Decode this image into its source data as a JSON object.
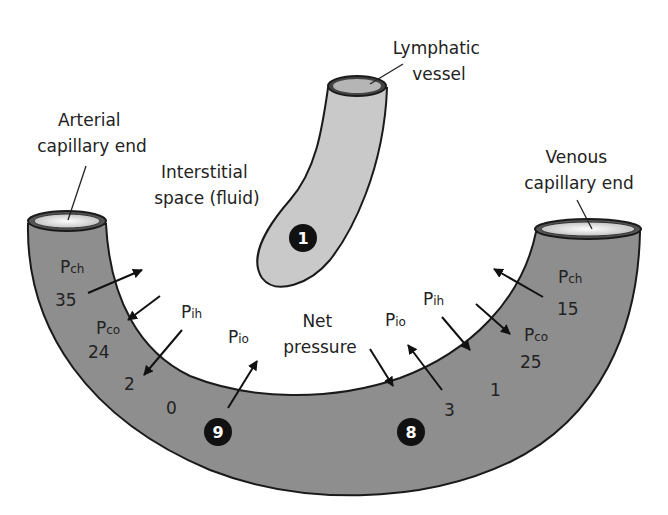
{
  "labels": {
    "arterial": [
      "Arterial",
      "capillary end"
    ],
    "venous": [
      "Venous",
      "capillary end"
    ],
    "lymphatic": [
      "Lymphatic",
      "vessel"
    ],
    "interstitial": [
      "Interstitial",
      "space (fluid)"
    ],
    "net_pressure": [
      "Net",
      "pressure"
    ]
  },
  "arterial_pressures": {
    "pch": {
      "symbol": "P",
      "sub": "ch",
      "value": "35"
    },
    "pco": {
      "symbol": "P",
      "sub": "co",
      "value": "24"
    },
    "pih": {
      "symbol": "P",
      "sub": "ih",
      "value": "2"
    },
    "pio": {
      "symbol": "P",
      "sub": "io",
      "value": "0"
    }
  },
  "venous_pressures": {
    "pch": {
      "symbol": "P",
      "sub": "ch",
      "value": "15"
    },
    "pco": {
      "symbol": "P",
      "sub": "co",
      "value": "25"
    },
    "pih": {
      "symbol": "P",
      "sub": "ih",
      "value": "1"
    },
    "pio": {
      "symbol": "P",
      "sub": "io",
      "value": "3"
    }
  },
  "badges": {
    "lymph": "1",
    "arterial_net": "9",
    "venous_net": "8"
  },
  "colors": {
    "capillary": "#8e8e8e",
    "lymph": "#c9c9c9",
    "lumen": "#e9e9e9",
    "outline": "#1a1a1a",
    "badge": "#111111"
  }
}
